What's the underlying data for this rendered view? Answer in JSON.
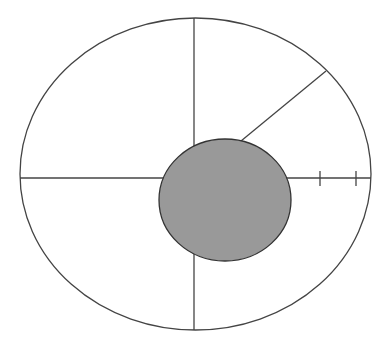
{
  "canvas": {
    "width": 386,
    "height": 347,
    "background": "#ffffff"
  },
  "colors": {
    "stroke": "#444444",
    "core_fill": "#999999",
    "core_stroke": "#333333"
  },
  "outer_ellipse": {
    "cx": 195.5,
    "cy": 174,
    "rx": 175.5,
    "ry": 156
  },
  "inner_disc": {
    "cx": 225,
    "cy": 200,
    "rx": 66,
    "ry": 61
  },
  "lines": {
    "vertical": {
      "x1": 194,
      "y1": 18,
      "x2": 194,
      "y2": 330
    },
    "horizontal": {
      "x1": 20,
      "y1": 178,
      "x2": 371,
      "y2": 178
    },
    "diagonal": {
      "x1": 241,
      "y1": 141,
      "x2": 326,
      "y2": 71
    }
  },
  "ticks": [
    {
      "x": 320,
      "y1": 171,
      "y2": 186
    },
    {
      "x": 356,
      "y1": 171,
      "y2": 186
    }
  ]
}
